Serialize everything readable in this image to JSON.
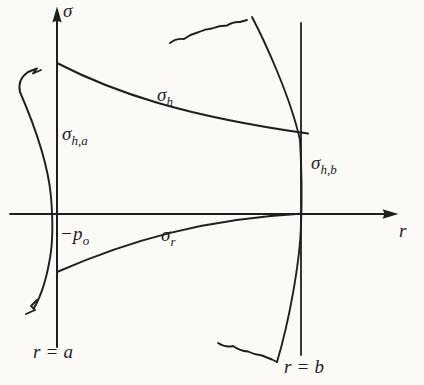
{
  "colors": {
    "paper": "#fbfaf7",
    "ink": "#1f1f1f"
  },
  "labels": {
    "sigma_axis": "σ",
    "r_axis": "r",
    "hoop_main": "σ",
    "hoop_sub": "h",
    "radial_main": "σ",
    "radial_sub": "r",
    "hoop_at_a_main": "σ",
    "hoop_at_a_sub": "h,a",
    "hoop_at_b_main": "σ",
    "hoop_at_b_sub": "h,b",
    "pressure_main": "−p",
    "pressure_sub": "o",
    "inner_radius": "r = a",
    "outer_radius": "r = b"
  }
}
